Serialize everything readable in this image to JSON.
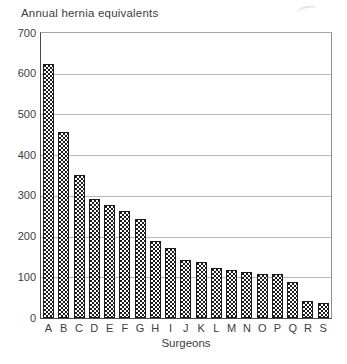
{
  "chart_data": {
    "type": "bar",
    "title": "Annual hernia equivalents",
    "xlabel": "Surgeons",
    "ylabel": "Annual hernia equivalents",
    "categories": [
      "A",
      "B",
      "C",
      "D",
      "E",
      "F",
      "G",
      "H",
      "I",
      "J",
      "K",
      "L",
      "M",
      "N",
      "O",
      "P",
      "Q",
      "R",
      "S"
    ],
    "values": [
      625,
      457,
      350,
      293,
      277,
      264,
      242,
      190,
      173,
      143,
      138,
      124,
      117,
      112,
      108,
      107,
      88,
      41,
      37
    ],
    "ylim": [
      0,
      700
    ],
    "yticks": [
      0,
      100,
      200,
      300,
      400,
      500,
      600,
      700
    ],
    "grid": "horizontal-only",
    "legend": "none",
    "bar_style": "white fill with black stipple dot pattern, thin black outline",
    "colors": {
      "background": "#ffffff",
      "axis": "#4a4a4a",
      "gridline": "#b9b9b9",
      "bar_outline": "#1c1c1c",
      "bar_dots": "#1c1c1c",
      "text": "#3d3d3d"
    }
  }
}
